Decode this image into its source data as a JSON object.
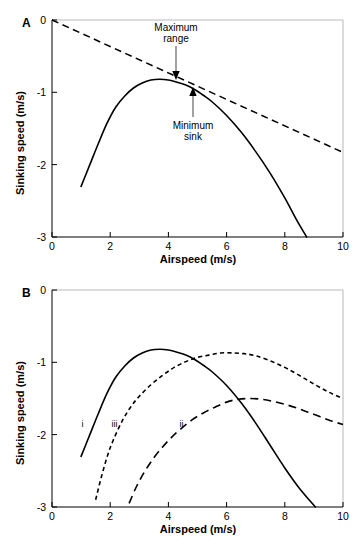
{
  "figure": {
    "panels": [
      {
        "id": "A",
        "letter": "A",
        "xlabel": "Airspeed (m/s)",
        "ylabel": "Sinking speed (m/s)"
      },
      {
        "id": "B",
        "letter": "B",
        "xlabel": "Airspeed (m/s)",
        "ylabel": "Sinking speed (m/s)"
      }
    ],
    "xticks": [
      "0",
      "2",
      "4",
      "6",
      "8",
      "10"
    ],
    "yticks": [
      "0",
      "-1",
      "-2",
      "-3"
    ],
    "annotations": {
      "maximum_range_line1": "Maximum",
      "maximum_range_line2": "range",
      "minimum_sink_line1": "Minimum",
      "minimum_sink_line2": "sink"
    },
    "curve_tags": {
      "i": "i",
      "ii": "ii",
      "iii": "iii"
    },
    "colors": {
      "ink": "#000000",
      "frame": "#b9b9b9",
      "background": "#ffffff"
    }
  },
  "chart_data": [
    {
      "type": "line",
      "panel": "A",
      "title": "",
      "xlabel": "Airspeed (m/s)",
      "ylabel": "Sinking speed (m/s)",
      "xlim": [
        0,
        10
      ],
      "ylim": [
        -3,
        0
      ],
      "xticks": [
        0,
        2,
        4,
        6,
        8,
        10
      ],
      "yticks": [
        0,
        -1,
        -2,
        -3
      ],
      "grid": false,
      "legend": "none",
      "annotations": [
        {
          "text": "Maximum range",
          "x": 3.7,
          "y": -0.82,
          "note": "tangent point from origin, arrow points down to curve"
        },
        {
          "text": "Minimum sink",
          "x": 4.85,
          "y": -0.93,
          "note": "arrow points up to curve"
        }
      ],
      "series": [
        {
          "name": "glide polar",
          "style": "solid",
          "x": [
            1.0,
            1.3,
            1.6,
            1.9,
            2.2,
            2.5,
            2.8,
            3.1,
            3.4,
            3.7,
            4.0,
            4.3,
            4.6,
            4.9,
            5.2,
            5.5,
            6.0,
            6.5,
            7.0,
            7.5,
            8.0,
            8.4,
            8.75
          ],
          "y": [
            -2.3,
            -2.0,
            -1.7,
            -1.42,
            -1.2,
            -1.05,
            -0.94,
            -0.87,
            -0.83,
            -0.82,
            -0.83,
            -0.86,
            -0.9,
            -0.96,
            -1.04,
            -1.13,
            -1.32,
            -1.55,
            -1.82,
            -2.12,
            -2.46,
            -2.76,
            -3.0
          ]
        },
        {
          "name": "tangent from origin (maximum range)",
          "style": "dashed",
          "x": [
            0,
            10
          ],
          "y": [
            0,
            -1.83
          ]
        }
      ]
    },
    {
      "type": "line",
      "panel": "B",
      "title": "",
      "xlabel": "Airspeed (m/s)",
      "ylabel": "Sinking speed (m/s)",
      "xlim": [
        0,
        10
      ],
      "ylim": [
        -3,
        0
      ],
      "xticks": [
        0,
        2,
        4,
        6,
        8,
        10
      ],
      "yticks": [
        0,
        -1,
        -2,
        -3
      ],
      "grid": false,
      "legend": "inline-labels",
      "series": [
        {
          "name": "i",
          "label": "i",
          "style": "solid",
          "label_x": 1.05,
          "label_y": -1.9,
          "x": [
            1.0,
            1.3,
            1.6,
            1.9,
            2.2,
            2.5,
            2.8,
            3.1,
            3.4,
            3.7,
            4.0,
            4.3,
            4.6,
            4.9,
            5.2,
            5.5,
            6.0,
            6.5,
            7.0,
            7.5,
            8.0,
            8.5,
            9.05
          ],
          "y": [
            -2.3,
            -2.0,
            -1.7,
            -1.42,
            -1.2,
            -1.05,
            -0.94,
            -0.87,
            -0.83,
            -0.82,
            -0.83,
            -0.86,
            -0.9,
            -0.96,
            -1.04,
            -1.13,
            -1.32,
            -1.56,
            -1.84,
            -2.15,
            -2.46,
            -2.74,
            -3.0
          ]
        },
        {
          "name": "iii",
          "label": "iii",
          "style": "short-dash",
          "label_x": 2.15,
          "label_y": -1.9,
          "x": [
            1.5,
            1.7,
            1.9,
            2.1,
            2.4,
            2.7,
            3.0,
            3.4,
            3.8,
            4.2,
            4.6,
            5.0,
            5.4,
            5.8,
            6.2,
            6.6,
            7.0,
            7.5,
            8.0,
            8.5,
            9.0,
            9.5,
            10.0
          ],
          "y": [
            -2.9,
            -2.58,
            -2.3,
            -2.08,
            -1.82,
            -1.62,
            -1.47,
            -1.31,
            -1.18,
            -1.07,
            -0.99,
            -0.93,
            -0.9,
            -0.87,
            -0.87,
            -0.88,
            -0.91,
            -0.98,
            -1.07,
            -1.18,
            -1.3,
            -1.41,
            -1.5
          ]
        },
        {
          "name": "ii",
          "label": "ii",
          "style": "long-dash",
          "label_x": 4.45,
          "label_y": -1.9,
          "x": [
            2.65,
            2.9,
            3.2,
            3.5,
            3.8,
            4.1,
            4.4,
            4.8,
            5.2,
            5.6,
            6.0,
            6.4,
            6.8,
            7.2,
            7.6,
            8.0,
            8.4,
            8.8,
            9.2,
            9.6,
            10.0
          ],
          "y": [
            -2.95,
            -2.72,
            -2.5,
            -2.32,
            -2.17,
            -2.04,
            -1.93,
            -1.8,
            -1.7,
            -1.62,
            -1.55,
            -1.51,
            -1.5,
            -1.51,
            -1.54,
            -1.58,
            -1.63,
            -1.69,
            -1.75,
            -1.81,
            -1.86
          ]
        }
      ]
    }
  ]
}
